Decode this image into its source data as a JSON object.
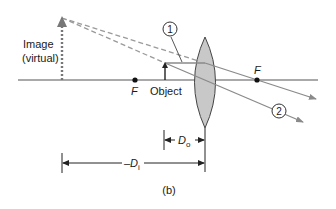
{
  "diagram": {
    "caption": "(b)",
    "labels": {
      "image_line1": "Image",
      "image_line2": "(virtual)",
      "object": "Object",
      "focal_left": "F",
      "focal_right": "F",
      "ray1": "1",
      "ray2": "2",
      "do_main": "D",
      "do_sub": "o",
      "di_prefix": "–D",
      "di_sub": "i"
    },
    "colors": {
      "axis": "#555555",
      "ray": "#8a8a8a",
      "dashed_ray": "#9a9a9a",
      "lens_fill": "#c8c8c8",
      "lens_stroke": "#444444",
      "image_arrow": "#777777",
      "object_arrow": "#222222",
      "text": "#1a1a1a"
    }
  }
}
